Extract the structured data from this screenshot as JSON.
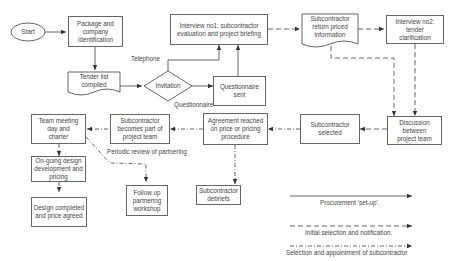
{
  "diagram": {
    "nodes": {
      "start": "Start",
      "package": "Package and company identification",
      "tender_list": "Tender list compiled",
      "invitation": "Invitation",
      "questionnaire_sent": "Questionnaire sent",
      "interview1": "Interview no1: subcontractor evaluation and project briefing",
      "return_priced": "Subcontractor return priced information",
      "interview2": "Interview no2: tender clarification",
      "discussion": "Discussion between project team",
      "selected": "Subcontractor selected",
      "agreement": "Agreement reached on price or pricing procedure",
      "becomes_part": "Subcontractor becomes part of project team",
      "team_meeting": "Team meeting day and charter",
      "ongoing_design": "On-going design development and pricing",
      "design_completed": "Design completed and price agreed",
      "follow_up": "Follow up partnering workshop",
      "debriefs": "Subcontractor debriefs"
    },
    "edge_labels": {
      "telephone": "Telephone",
      "questionnaire": "Questionnaire",
      "periodic_review": "Periodic review of partnering"
    },
    "legend": [
      {
        "style": "solid",
        "label": "Procurement 'set-up'."
      },
      {
        "style": "dashed",
        "label": "Initial selection and notification."
      },
      {
        "style": "dash-dot",
        "label": "Selection and appointment of subcontractor"
      }
    ],
    "colors": {
      "line": "#444444",
      "box_border": "#666666",
      "text": "#444444"
    }
  }
}
